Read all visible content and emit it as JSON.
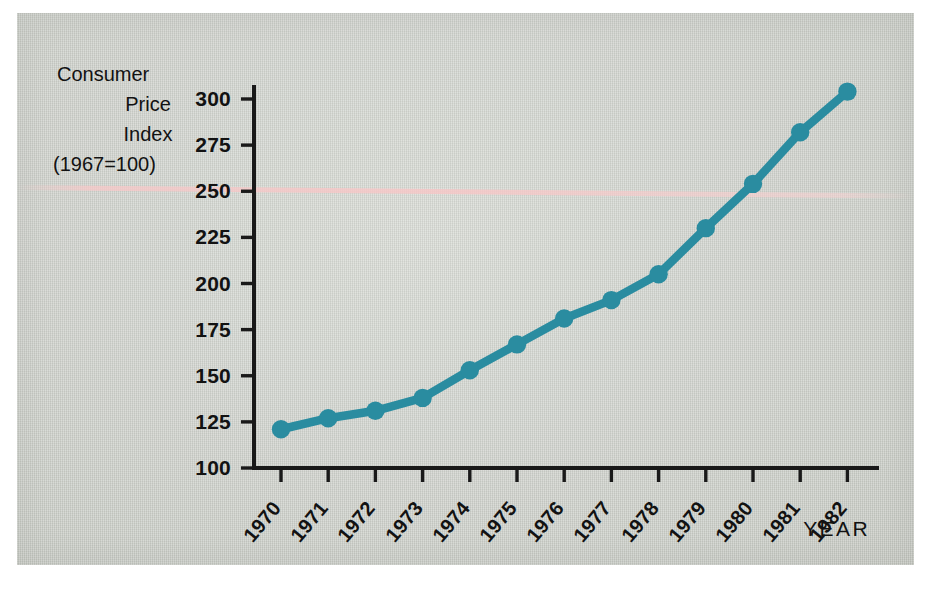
{
  "figure": {
    "background_color": "#d3d6d1",
    "accent_color": "#2a8ca0",
    "axis_color": "#191919",
    "title_lines": [
      "Consumer",
      "Price",
      "Index",
      "(1967=100)"
    ],
    "xaxis_title": "YEAR"
  },
  "chart_data": {
    "type": "line",
    "title": "Consumer Price Index (1967=100)",
    "xlabel": "YEAR",
    "ylabel": "Consumer Price Index (1967=100)",
    "categories": [
      "1970",
      "1971",
      "1972",
      "1973",
      "1974",
      "1975",
      "1976",
      "1977",
      "1978",
      "1979",
      "1980",
      "1981",
      "1982"
    ],
    "values": [
      121,
      127,
      131,
      138,
      153,
      167,
      181,
      191,
      205,
      230,
      254,
      282,
      304
    ],
    "series": [
      {
        "name": "Consumer Price Index",
        "color": "#2a8ca0",
        "marker": "circle",
        "values": [
          121,
          127,
          131,
          138,
          153,
          167,
          181,
          191,
          205,
          230,
          254,
          282,
          304
        ]
      }
    ],
    "ylim": [
      100,
      310
    ],
    "yticks": [
      100,
      125,
      150,
      175,
      200,
      225,
      250,
      275,
      300
    ],
    "ytick_labels": [
      "100",
      "125",
      "150",
      "175",
      "200",
      "225",
      "250",
      "275",
      "300"
    ],
    "xtick_labels": [
      "1970",
      "1971",
      "1972",
      "1973",
      "1974",
      "1975",
      "1976",
      "1977",
      "1978",
      "1979",
      "1980",
      "1981",
      "1982"
    ],
    "xtick_rotation": -50,
    "grid": false,
    "legend": null
  }
}
